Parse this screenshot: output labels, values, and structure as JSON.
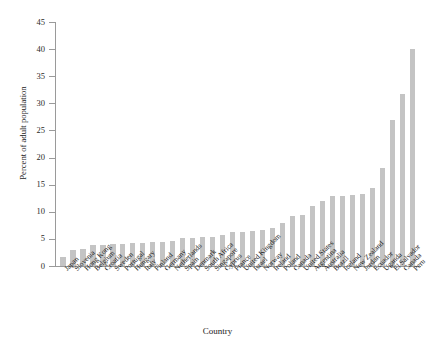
{
  "chart_data": {
    "type": "bar",
    "title": "",
    "xlabel": "Country",
    "ylabel": "Percent of adult population",
    "ylim": [
      0,
      45
    ],
    "yticks": [
      0,
      5,
      10,
      15,
      20,
      25,
      30,
      35,
      40,
      45
    ],
    "ytick_labels": [
      "0",
      "5",
      "10",
      "15",
      "20",
      "25",
      "30",
      "35",
      "40",
      "45"
    ],
    "grid": false,
    "legend": false,
    "bar_color": "#c4c4c4",
    "axis_color": "#9a9a9a",
    "categories": [
      "Japan",
      "Slovenia",
      "Hong Kong",
      "Belgium",
      "Croatia",
      "Sweden",
      "Portugal",
      "Hungary",
      "Italy",
      "Finland",
      "Germany",
      "Netherlands",
      "Spain",
      "Denmark",
      "South Africa",
      "Singapore",
      "Cyprus",
      "France",
      "United Kingdom",
      "Israel",
      "Norway",
      "Ireland",
      "Poland",
      "Canada",
      "United States",
      "Argentina",
      "Australia",
      "Brazil",
      "Iceland",
      "New Zealand",
      "Jordan",
      "Ecuador",
      "Uganda",
      "El Salvador",
      "Canada",
      "Peru"
    ],
    "values": [
      1.7,
      2.9,
      3.2,
      3.8,
      3.9,
      4.0,
      4.1,
      4.2,
      4.3,
      4.4,
      4.5,
      4.6,
      5.1,
      5.2,
      5.4,
      5.4,
      5.8,
      6.2,
      6.3,
      6.4,
      6.6,
      7.0,
      8.0,
      9.3,
      9.4,
      11.1,
      11.9,
      12.9,
      13.0,
      13.1,
      13.3,
      14.4,
      18.0,
      27.0,
      31.8,
      40.0
    ]
  },
  "axis": {
    "y_title": "Percent of adult population",
    "x_title": "Country"
  }
}
